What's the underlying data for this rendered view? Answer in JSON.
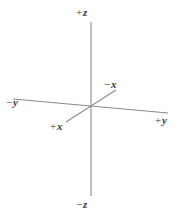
{
  "figure": {
    "background_color": "#ffffff",
    "line_color": "#8a8a8a",
    "label_color": "#3a3a3a",
    "width": 181,
    "height": 216
  },
  "axes": [
    {
      "id": "z-axis",
      "name": "z",
      "orientation": "vertical",
      "x1": 91,
      "y1": 22,
      "x2": 91,
      "y2": 196
    },
    {
      "id": "y-axis",
      "name": "y",
      "orientation": "near-horizontal",
      "x1": 13,
      "y1": 99,
      "x2": 168,
      "y2": 113
    },
    {
      "id": "x-axis",
      "name": "x",
      "orientation": "diagonal",
      "x1": 66,
      "y1": 122,
      "x2": 116,
      "y2": 90
    }
  ],
  "labels": {
    "pos_z": {
      "sign": "+",
      "axis": "z"
    },
    "neg_z": {
      "sign": "−",
      "axis": "z"
    },
    "pos_y": {
      "sign": "+",
      "axis": "y"
    },
    "neg_y": {
      "sign": "−",
      "axis": "y"
    },
    "pos_x": {
      "sign": "+",
      "axis": "x"
    },
    "neg_x": {
      "sign": "−",
      "axis": "x"
    }
  },
  "origin": {
    "x": 91,
    "y": 107
  }
}
